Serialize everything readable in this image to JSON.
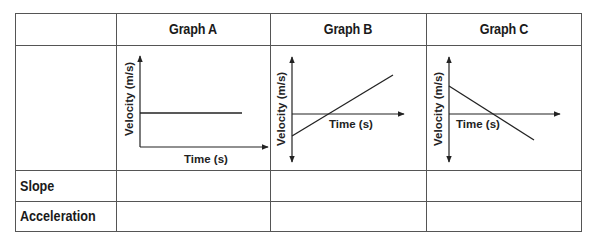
{
  "table": {
    "columns": [
      "",
      "Graph A",
      "Graph B",
      "Graph C"
    ],
    "rows": [
      {
        "label": "",
        "cells": [
          "graph",
          "graph",
          "graph"
        ]
      },
      {
        "label": "Slope",
        "cells": [
          "",
          "",
          ""
        ]
      },
      {
        "label": "Acceleration",
        "cells": [
          "",
          "",
          ""
        ]
      }
    ]
  },
  "graphs": {
    "a": {
      "title": "Graph A",
      "y_label": "Velocity (m/s)",
      "x_label": "Time (s)",
      "description": "horizontal line, constant positive velocity"
    },
    "b": {
      "title": "Graph B",
      "y_label": "Velocity (m/s)",
      "x_label": "Time (s)",
      "description": "line increasing from negative to positive velocity"
    },
    "c": {
      "title": "Graph C",
      "y_label": "Velocity (m/s)",
      "x_label": "Time (s)",
      "description": "line decreasing from positive to negative velocity"
    }
  },
  "colors": {
    "line": "#222222",
    "border": "#555555"
  }
}
